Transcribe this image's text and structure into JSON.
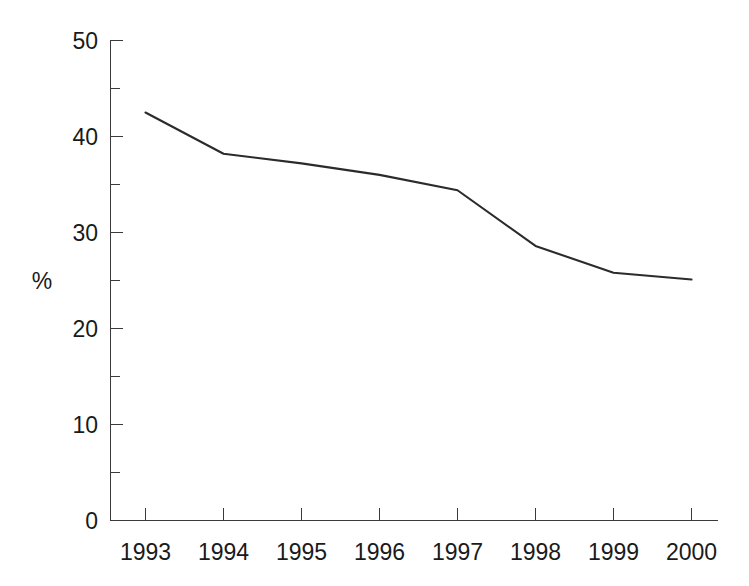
{
  "chart_data": {
    "type": "line",
    "title": "",
    "subtitle": "",
    "xlabel": "",
    "ylabel": "%",
    "categories": [
      "1993",
      "1994",
      "1995",
      "1996",
      "1997",
      "1998",
      "1999",
      "2000"
    ],
    "x": [
      1993,
      1994,
      1995,
      1996,
      1997,
      1998,
      1999,
      2000
    ],
    "values": [
      42.5,
      38.2,
      37.2,
      36.0,
      34.4,
      28.6,
      25.8,
      25.1
    ],
    "series": [
      {
        "name": "",
        "values": [
          42.5,
          38.2,
          37.2,
          36.0,
          34.4,
          28.6,
          25.8,
          25.1
        ]
      }
    ],
    "ylim": [
      0,
      50
    ],
    "xlim": [
      1993,
      2000
    ],
    "y_major_ticks": [
      0,
      10,
      20,
      30,
      40,
      50
    ],
    "y_major_tick_labels": [
      "0",
      "10",
      "20",
      "30",
      "40",
      "50"
    ],
    "y_minor_ticks": [
      5,
      15,
      25,
      35,
      45
    ],
    "grid": false,
    "legend": false,
    "legend_position": "none",
    "line_color": "#2b2b2b",
    "axis_color": "#3a3a3a",
    "background_color": "#ffffff",
    "markers": false,
    "annotations": []
  },
  "axis": {
    "y_title": "%",
    "x_tick_labels": [
      "1993",
      "1994",
      "1995",
      "1996",
      "1997",
      "1998",
      "1999",
      "2000"
    ],
    "y_tick_labels": [
      "50",
      "40",
      "30",
      "20",
      "10",
      "0"
    ]
  }
}
